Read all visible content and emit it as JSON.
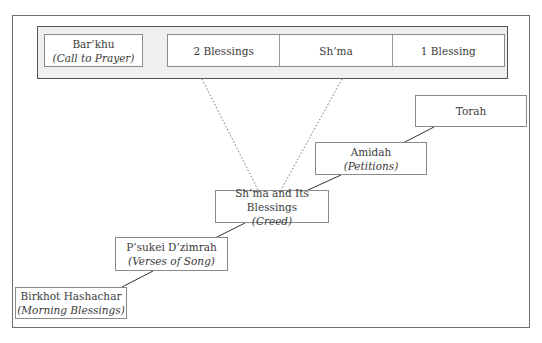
{
  "diagram": {
    "top_group": {
      "barkhu": {
        "title": "Bar’khu",
        "subtitle": "(Call to Prayer)"
      },
      "shma_parts": [
        {
          "label": "2 Blessings"
        },
        {
          "label": "Sh’ma"
        },
        {
          "label": "1 Blessing"
        }
      ]
    },
    "steps": [
      {
        "title": "Birkhot Hashachar",
        "subtitle": "(Morning Blessings)"
      },
      {
        "title": "P’sukei D’zimrah",
        "subtitle": "(Verses of Song)"
      },
      {
        "title": "Sh’ma and Its Blessings",
        "subtitle": "(Creed)"
      },
      {
        "title": "Amidah",
        "subtitle": "(Petitions)"
      },
      {
        "title": "Torah",
        "subtitle": ""
      }
    ],
    "colors": {
      "frame_border": "#6e6e6e",
      "group_fill": "#efefef",
      "box_border": "#8a8a8a",
      "text": "#3a3a3a"
    }
  }
}
